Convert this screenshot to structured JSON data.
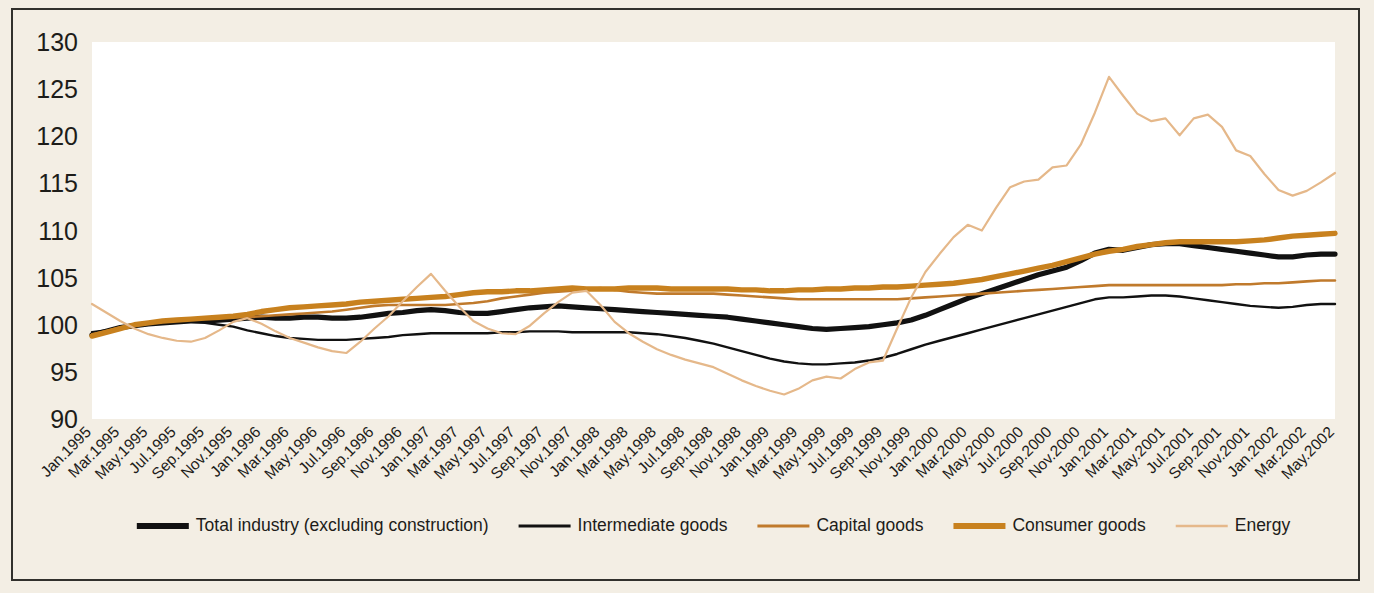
{
  "figure": {
    "background_color": "#f3eee4",
    "plot_background_color": "#ffffff",
    "border_color": "#31302c"
  },
  "chart_data": {
    "type": "line",
    "title": "",
    "subtitle": "",
    "xlabel": "",
    "ylabel": "",
    "grid": false,
    "legend_position": "bottom",
    "ylim": [
      90,
      130
    ],
    "yticks": [
      90,
      95,
      100,
      105,
      110,
      115,
      120,
      125,
      130
    ],
    "x": [
      "Jan.1995",
      "Feb.1995",
      "Mar.1995",
      "Apr.1995",
      "May.1995",
      "Jun.1995",
      "Jul.1995",
      "Aug.1995",
      "Sep.1995",
      "Oct.1995",
      "Nov.1995",
      "Dec.1995",
      "Jan.1996",
      "Feb.1996",
      "Mar.1996",
      "Apr.1996",
      "May.1996",
      "Jun.1996",
      "Jul.1996",
      "Aug.1996",
      "Sep.1996",
      "Oct.1996",
      "Nov.1996",
      "Dec.1996",
      "Jan.1997",
      "Feb.1997",
      "Mar.1997",
      "Apr.1997",
      "May.1997",
      "Jun.1997",
      "Jul.1997",
      "Aug.1997",
      "Sep.1997",
      "Oct.1997",
      "Nov.1997",
      "Dec.1997",
      "Jan.1998",
      "Feb.1998",
      "Mar.1998",
      "Apr.1998",
      "May.1998",
      "Jun.1998",
      "Jul.1998",
      "Aug.1998",
      "Sep.1998",
      "Oct.1998",
      "Nov.1998",
      "Dec.1998",
      "Jan.1999",
      "Feb.1999",
      "Mar.1999",
      "Apr.1999",
      "May.1999",
      "Jun.1999",
      "Jul.1999",
      "Aug.1999",
      "Sep.1999",
      "Oct.1999",
      "Nov.1999",
      "Dec.1999",
      "Jan.2000",
      "Feb.2000",
      "Mar.2000",
      "Apr.2000",
      "May.2000",
      "Jun.2000",
      "Jul.2000",
      "Aug.2000",
      "Sep.2000",
      "Oct.2000",
      "Nov.2000",
      "Dec.2000",
      "Jan.2001",
      "Feb.2001",
      "Mar.2001",
      "Apr.2001",
      "May.2001",
      "Jun.2001",
      "Jul.2001",
      "Aug.2001",
      "Sep.2001",
      "Oct.2001",
      "Nov.2001",
      "Dec.2001",
      "Jan.2002",
      "Feb.2002",
      "Mar.2002",
      "Apr.2002",
      "May.2002"
    ],
    "xtick_labels": [
      "Jan.1995",
      "Mar.1995",
      "May.1995",
      "Jul.1995",
      "Sep.1995",
      "Nov.1995",
      "Jan.1996",
      "Mar.1996",
      "May.1996",
      "Jul.1996",
      "Sep.1996",
      "Nov.1996",
      "Jan.1997",
      "Mar.1997",
      "May.1997",
      "Jul.1997",
      "Sep.1997",
      "Nov.1997",
      "Jan.1998",
      "Mar.1998",
      "May.1998",
      "Jul.1998",
      "Sep.1998",
      "Nov.1998",
      "Jan.1999",
      "Mar.1999",
      "May.1999",
      "Jul.1999",
      "Sep.1999",
      "Nov.1999",
      "Jan.2000",
      "Mar.2000",
      "May.2000",
      "Jul.2000",
      "Sep.2000",
      "Nov.2000",
      "Jan.2001",
      "Mar.2001",
      "May.2001",
      "Jul.2001",
      "Sep.2001",
      "Nov.2001",
      "Jan.2002",
      "Mar.2002",
      "May.2002"
    ],
    "series": [
      {
        "name": "Total industry (excluding construction)",
        "color": "#111111",
        "width": 5.2,
        "values": [
          98.9,
          99.3,
          99.7,
          99.9,
          100.1,
          100.2,
          100.3,
          100.4,
          100.4,
          100.5,
          100.6,
          100.7,
          100.8,
          100.7,
          100.7,
          100.8,
          100.8,
          100.7,
          100.7,
          100.8,
          101.0,
          101.2,
          101.3,
          101.5,
          101.6,
          101.5,
          101.3,
          101.2,
          101.2,
          101.4,
          101.6,
          101.8,
          101.9,
          102.0,
          101.9,
          101.8,
          101.7,
          101.6,
          101.5,
          101.4,
          101.3,
          101.2,
          101.1,
          101.0,
          100.9,
          100.8,
          100.6,
          100.4,
          100.2,
          100.0,
          99.8,
          99.6,
          99.5,
          99.6,
          99.7,
          99.8,
          100.0,
          100.2,
          100.5,
          101.0,
          101.6,
          102.2,
          102.8,
          103.3,
          103.8,
          104.3,
          104.8,
          105.3,
          105.7,
          106.1,
          106.8,
          107.6,
          108.0,
          107.9,
          108.2,
          108.5,
          108.6,
          108.6,
          108.4,
          108.2,
          108.0,
          107.8,
          107.6,
          107.4,
          107.2,
          107.2,
          107.4,
          107.5,
          107.5
        ]
      },
      {
        "name": "Intermediate goods",
        "color": "#111111",
        "width": 2.4,
        "values": [
          99.2,
          99.4,
          99.7,
          99.9,
          100.1,
          100.3,
          100.3,
          100.3,
          100.2,
          100.0,
          99.8,
          99.4,
          99.1,
          98.8,
          98.6,
          98.5,
          98.4,
          98.4,
          98.4,
          98.5,
          98.6,
          98.7,
          98.9,
          99.0,
          99.1,
          99.1,
          99.1,
          99.1,
          99.1,
          99.2,
          99.2,
          99.3,
          99.3,
          99.3,
          99.2,
          99.2,
          99.2,
          99.2,
          99.2,
          99.1,
          99.0,
          98.8,
          98.6,
          98.3,
          98.0,
          97.6,
          97.2,
          96.8,
          96.4,
          96.1,
          95.9,
          95.8,
          95.8,
          95.9,
          96.0,
          96.2,
          96.5,
          96.9,
          97.4,
          97.9,
          98.3,
          98.7,
          99.1,
          99.5,
          99.9,
          100.3,
          100.7,
          101.1,
          101.5,
          101.9,
          102.3,
          102.7,
          102.9,
          102.9,
          103.0,
          103.1,
          103.1,
          103.0,
          102.8,
          102.6,
          102.4,
          102.2,
          102.0,
          101.9,
          101.8,
          101.9,
          102.1,
          102.2,
          102.2
        ]
      },
      {
        "name": "Capital goods",
        "color": "#c07a2c",
        "width": 2.6,
        "values": [
          99.0,
          99.3,
          99.7,
          100.0,
          100.2,
          100.4,
          100.5,
          100.6,
          100.7,
          100.8,
          100.8,
          100.8,
          100.9,
          101.0,
          101.1,
          101.2,
          101.3,
          101.4,
          101.6,
          101.8,
          102.0,
          102.1,
          102.1,
          102.1,
          102.1,
          102.1,
          102.2,
          102.3,
          102.5,
          102.8,
          103.0,
          103.2,
          103.4,
          103.5,
          103.6,
          103.8,
          103.9,
          103.7,
          103.5,
          103.4,
          103.3,
          103.3,
          103.3,
          103.3,
          103.3,
          103.2,
          103.1,
          103.0,
          102.9,
          102.8,
          102.7,
          102.7,
          102.7,
          102.7,
          102.7,
          102.7,
          102.7,
          102.7,
          102.8,
          102.9,
          103.0,
          103.1,
          103.2,
          103.3,
          103.4,
          103.5,
          103.6,
          103.7,
          103.8,
          103.9,
          104.0,
          104.1,
          104.2,
          104.2,
          104.2,
          104.2,
          104.2,
          104.2,
          104.2,
          104.2,
          104.2,
          104.3,
          104.3,
          104.4,
          104.4,
          104.5,
          104.6,
          104.7,
          104.7
        ]
      },
      {
        "name": "Consumer goods",
        "color": "#c8811e",
        "width": 5.4,
        "values": [
          98.8,
          99.2,
          99.6,
          100.0,
          100.2,
          100.4,
          100.5,
          100.6,
          100.7,
          100.8,
          100.9,
          101.1,
          101.4,
          101.6,
          101.8,
          101.9,
          102.0,
          102.1,
          102.2,
          102.4,
          102.5,
          102.6,
          102.7,
          102.8,
          102.9,
          103.0,
          103.2,
          103.4,
          103.5,
          103.5,
          103.6,
          103.6,
          103.7,
          103.8,
          103.9,
          103.8,
          103.8,
          103.8,
          103.9,
          103.9,
          103.9,
          103.8,
          103.8,
          103.8,
          103.8,
          103.8,
          103.7,
          103.7,
          103.6,
          103.6,
          103.7,
          103.7,
          103.8,
          103.8,
          103.9,
          103.9,
          104.0,
          104.0,
          104.1,
          104.2,
          104.3,
          104.4,
          104.6,
          104.8,
          105.1,
          105.4,
          105.7,
          106.0,
          106.3,
          106.7,
          107.1,
          107.5,
          107.8,
          108.0,
          108.3,
          108.5,
          108.7,
          108.8,
          108.8,
          108.8,
          108.8,
          108.8,
          108.9,
          109.0,
          109.2,
          109.4,
          109.5,
          109.6,
          109.7
        ]
      },
      {
        "name": "Energy",
        "color": "#e5b88a",
        "width": 2.2,
        "values": [
          102.2,
          101.3,
          100.4,
          99.6,
          99.0,
          98.6,
          98.3,
          98.2,
          98.6,
          99.4,
          100.3,
          100.7,
          100.1,
          99.3,
          98.6,
          98.1,
          97.6,
          97.2,
          97.0,
          98.2,
          99.6,
          100.9,
          102.5,
          104.0,
          105.4,
          103.6,
          101.9,
          100.4,
          99.6,
          99.1,
          99.0,
          99.9,
          101.2,
          102.4,
          103.4,
          103.6,
          102.1,
          100.3,
          99.1,
          98.2,
          97.4,
          96.8,
          96.3,
          95.9,
          95.5,
          94.8,
          94.1,
          93.5,
          93.0,
          92.6,
          93.2,
          94.1,
          94.5,
          94.3,
          95.3,
          96.0,
          96.2,
          99.6,
          102.9,
          105.6,
          107.5,
          109.3,
          110.6,
          110.0,
          112.4,
          114.6,
          115.2,
          115.4,
          116.7,
          116.9,
          119.1,
          122.5,
          126.3,
          124.3,
          122.4,
          121.6,
          121.9,
          120.1,
          121.9,
          122.3,
          121.0,
          118.5,
          117.9,
          116.0,
          114.3,
          113.7,
          114.2,
          115.1,
          116.1
        ]
      }
    ]
  },
  "legend": {
    "items": [
      {
        "label": "Total industry (excluding construction)",
        "color": "#111111",
        "width": 6
      },
      {
        "label": "Intermediate goods",
        "color": "#111111",
        "width": 3
      },
      {
        "label": "Capital goods",
        "color": "#c07a2c",
        "width": 3
      },
      {
        "label": "Consumer goods",
        "color": "#c8811e",
        "width": 6
      },
      {
        "label": "Energy",
        "color": "#e5b88a",
        "width": 2.5
      }
    ]
  }
}
